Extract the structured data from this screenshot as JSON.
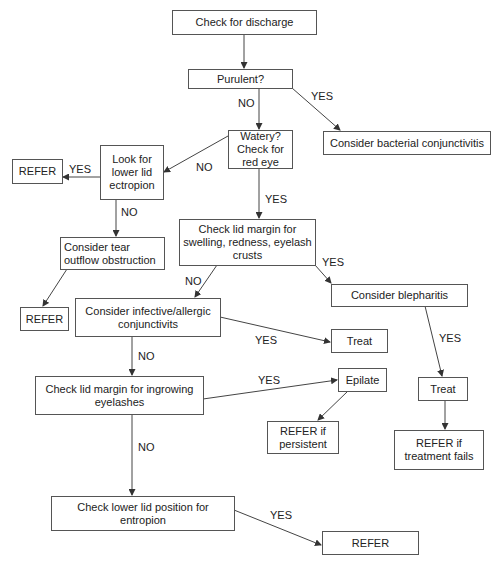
{
  "diagram": {
    "title": "",
    "nodes": [
      {
        "id": "check-discharge",
        "text": "Check for discharge"
      },
      {
        "id": "purulent",
        "text": "Purulent?"
      },
      {
        "id": "watery",
        "text": "Watery? Check for red eye"
      },
      {
        "id": "bacterial",
        "text": "Consider bacterial conjunctivitis"
      },
      {
        "id": "refer-ectropion",
        "text": "REFER"
      },
      {
        "id": "ectropion",
        "text": "Look for lower lid ectropion"
      },
      {
        "id": "tear-outflow",
        "text": "Consider tear outflow obstruction"
      },
      {
        "id": "lid-margin-swelling",
        "text": "Check lid margin for swelling, redness, eyelash crusts"
      },
      {
        "id": "refer-tear",
        "text": "REFER"
      },
      {
        "id": "infective",
        "text": "Consider infective/allergic conjunctivits"
      },
      {
        "id": "blepharitis",
        "text": "Consider blepharitis"
      },
      {
        "id": "treat-infective",
        "text": "Treat"
      },
      {
        "id": "ingrowing",
        "text": "Check lid margin for ingrowing eyelashes"
      },
      {
        "id": "epilate",
        "text": "Epilate"
      },
      {
        "id": "refer-persistent",
        "text": "REFER if persistent"
      },
      {
        "id": "treat-blepharitis",
        "text": "Treat"
      },
      {
        "id": "refer-treatment-fails",
        "text": "REFER if treatment fails"
      },
      {
        "id": "entropion",
        "text": "Check lower lid position for entropion"
      },
      {
        "id": "refer-entropion",
        "text": "REFER"
      }
    ],
    "edges": [
      {
        "from": "check-discharge",
        "to": "purulent",
        "label": ""
      },
      {
        "from": "purulent",
        "to": "watery",
        "label": "NO"
      },
      {
        "from": "purulent",
        "to": "bacterial",
        "label": "YES"
      },
      {
        "from": "watery",
        "to": "ectropion",
        "label": "NO"
      },
      {
        "from": "watery",
        "to": "lid-margin-swelling",
        "label": "YES"
      },
      {
        "from": "ectropion",
        "to": "refer-ectropion",
        "label": "YES"
      },
      {
        "from": "ectropion",
        "to": "tear-outflow",
        "label": "NO"
      },
      {
        "from": "tear-outflow",
        "to": "refer-tear",
        "label": ""
      },
      {
        "from": "lid-margin-swelling",
        "to": "infective",
        "label": "NO"
      },
      {
        "from": "lid-margin-swelling",
        "to": "blepharitis",
        "label": "YES"
      },
      {
        "from": "infective",
        "to": "treat-infective",
        "label": "YES"
      },
      {
        "from": "infective",
        "to": "ingrowing",
        "label": "NO"
      },
      {
        "from": "blepharitis",
        "to": "treat-blepharitis",
        "label": "YES"
      },
      {
        "from": "treat-blepharitis",
        "to": "refer-treatment-fails",
        "label": ""
      },
      {
        "from": "ingrowing",
        "to": "epilate",
        "label": "YES"
      },
      {
        "from": "epilate",
        "to": "refer-persistent",
        "label": ""
      },
      {
        "from": "ingrowing",
        "to": "entropion",
        "label": "NO"
      },
      {
        "from": "entropion",
        "to": "refer-entropion",
        "label": "YES"
      }
    ],
    "labels": {
      "no": "NO",
      "yes": "YES"
    }
  }
}
